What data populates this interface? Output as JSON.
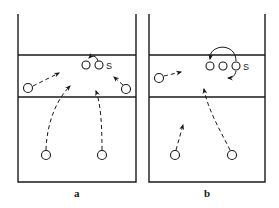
{
  "diagram": {
    "panels": [
      {
        "id": "a",
        "label": "a",
        "setter_label": "S",
        "players": 6,
        "setter_movement": "short curved arrow from setter toward adjacent front player",
        "movements": [
          "left player moves diagonally toward net",
          "back-left player moves up toward front zone",
          "back-right player moves up toward front zone",
          "right player moves diagonally toward setter"
        ]
      },
      {
        "id": "b",
        "label": "b",
        "setter_label": "S",
        "players": 6,
        "setter_movement": "large arc arrow over two front players, plus short move back from setter",
        "movements": [
          "left player moves right",
          "back-left player moves up",
          "back-right player moves diagonally up-left into front zone"
        ]
      }
    ]
  }
}
